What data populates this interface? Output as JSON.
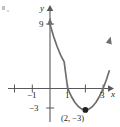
{
  "figure": {
    "background": "#ffffff",
    "curve_color": "#6e6e6e",
    "axis_color": "#58595b",
    "text_color": "#231f20",
    "point_color": "#231f20"
  },
  "axis_labels": {
    "x": "x",
    "y": "y"
  },
  "annotation": {
    "vertex_label": "(2, −3)"
  },
  "chart_data": {
    "type": "line",
    "title": "",
    "subtitle": "",
    "xlabel": "x",
    "ylabel": "y",
    "grid": false,
    "legend": null,
    "xlim": [
      -2.2,
      3.5
    ],
    "ylim": [
      -5.0,
      10.5
    ],
    "x_ticks": [
      -2,
      -1,
      0,
      1,
      2,
      3
    ],
    "x_tick_labels": [
      "",
      "−1",
      "",
      "1",
      "",
      "3"
    ],
    "y_ticks": [
      9,
      -3
    ],
    "y_tick_labels": [
      "9",
      "−3"
    ],
    "function": "y = 3(x − 2)² − 3",
    "vertex": [
      2,
      -3
    ],
    "roots": [
      1,
      3
    ],
    "y_intercept": 9,
    "arrows": [
      "x-axis-right",
      "y-axis-up",
      "curve-left-up",
      "curve-right-up"
    ],
    "series": [
      {
        "name": "parabola",
        "x": [
          0.0,
          0.2,
          0.4,
          0.6,
          0.8,
          1.0,
          1.2,
          1.4,
          1.6,
          1.8,
          2.0,
          2.2,
          2.4,
          2.6,
          2.8,
          3.0,
          3.2,
          3.35
        ],
        "values": [
          9.0,
          7.32,
          5.88,
          4.68,
          3.72,
          0.0,
          -1.08,
          -1.92,
          -2.52,
          -2.88,
          -3.0,
          -2.88,
          -2.52,
          -1.92,
          -1.08,
          0.0,
          1.32,
          2.47
        ]
      }
    ],
    "points": [
      {
        "label": "(2, −3)",
        "x": 2,
        "y": -3,
        "marker": "filled-circle"
      }
    ]
  }
}
